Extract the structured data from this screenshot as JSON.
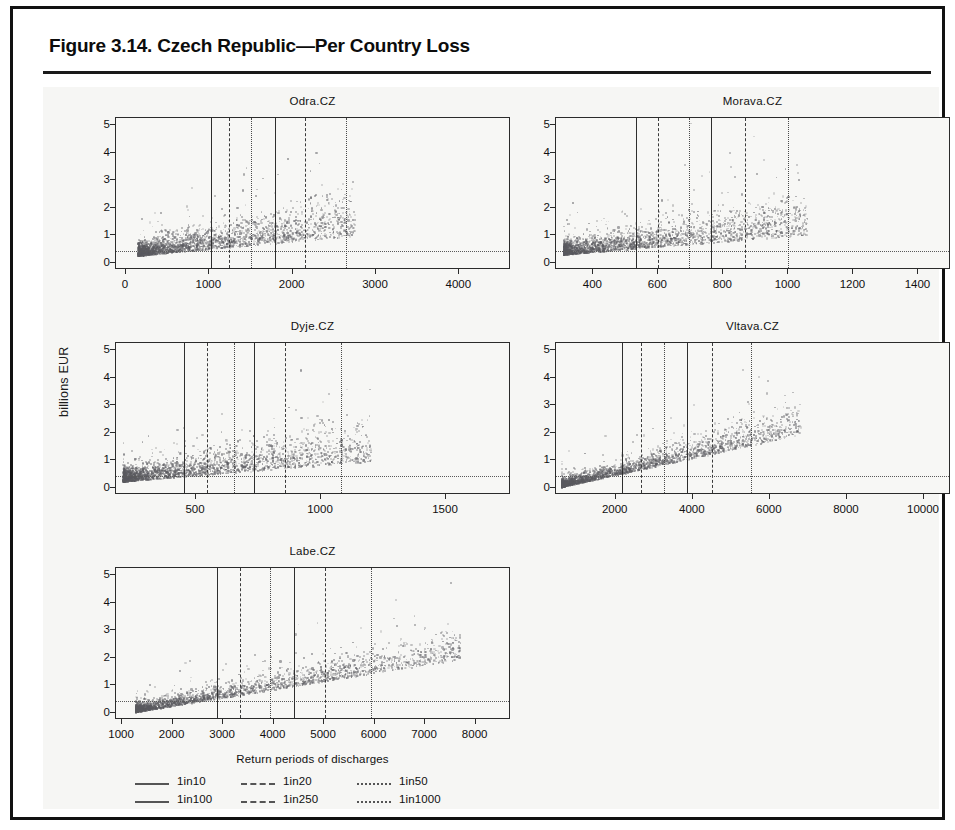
{
  "figure": {
    "title": "Figure 3.14. Czech Republic—Per Country Loss"
  },
  "axes": {
    "ylabel": "billions EUR",
    "xlabel": "Return periods of discharges"
  },
  "legend": {
    "items": [
      {
        "label": "1in10",
        "style": "solid"
      },
      {
        "label": "1in20",
        "style": "dashed"
      },
      {
        "label": "1in50",
        "style": "dotted"
      },
      {
        "label": "1in100",
        "style": "solid"
      },
      {
        "label": "1in250",
        "style": "dashed"
      },
      {
        "label": "1in1000",
        "style": "dotted"
      }
    ]
  },
  "chart_data": {
    "type": "scatter",
    "title": "Figure 3.14. Czech Republic—Per Country Loss",
    "xlabel": "Return periods of discharges",
    "ylabel": "billions EUR",
    "grid": false,
    "legend_position": "bottom-left",
    "ylim": [
      -0.25,
      5.25
    ],
    "yticks": [
      0,
      1,
      2,
      3,
      4,
      5
    ],
    "series_legend": [
      "1in10",
      "1in20",
      "1in50",
      "1in100",
      "1in250",
      "1in1000"
    ],
    "horizontal_reference_line": 0.42,
    "panels": [
      {
        "name": "Odra.CZ",
        "xlim": [
          -120,
          4620
        ],
        "xticks": [
          0,
          1000,
          2000,
          3000,
          4000
        ],
        "x_data_min": 150,
        "x_data_max": 2750,
        "cloud_y_typical": 0.55,
        "cloud_y_spread": 1.9,
        "vlines": [
          {
            "label": "1in10",
            "x": 1020,
            "style": "solid"
          },
          {
            "label": "1in20",
            "x": 1230,
            "style": "dashed"
          },
          {
            "label": "1in50",
            "x": 1500,
            "style": "dotted"
          },
          {
            "label": "1in100",
            "x": 1790,
            "style": "solid"
          },
          {
            "label": "1in250",
            "x": 2150,
            "style": "dashed"
          },
          {
            "label": "1in1000",
            "x": 2640,
            "style": "dotted"
          }
        ]
      },
      {
        "name": "Morava.CZ",
        "xlim": [
          285,
          1500
        ],
        "xticks": [
          400,
          600,
          800,
          1000,
          1200,
          1400
        ],
        "x_data_min": 310,
        "x_data_max": 1060,
        "cloud_y_typical": 0.62,
        "cloud_y_spread": 1.8,
        "vlines": [
          {
            "label": "1in10",
            "x": 530,
            "style": "solid"
          },
          {
            "label": "1in20",
            "x": 600,
            "style": "dashed"
          },
          {
            "label": "1in50",
            "x": 695,
            "style": "dotted"
          },
          {
            "label": "1in100",
            "x": 762,
            "style": "solid"
          },
          {
            "label": "1in250",
            "x": 865,
            "style": "dashed"
          },
          {
            "label": "1in1000",
            "x": 1000,
            "style": "dotted"
          }
        ]
      },
      {
        "name": "Dyje.CZ",
        "xlim": [
          180,
          1760
        ],
        "xticks": [
          500,
          1000,
          1500
        ],
        "x_data_min": 210,
        "x_data_max": 1200,
        "cloud_y_typical": 0.5,
        "cloud_y_spread": 1.7,
        "vlines": [
          {
            "label": "1in10",
            "x": 453,
            "style": "solid"
          },
          {
            "label": "1in20",
            "x": 543,
            "style": "dashed"
          },
          {
            "label": "1in50",
            "x": 650,
            "style": "dotted"
          },
          {
            "label": "1in100",
            "x": 730,
            "style": "solid"
          },
          {
            "label": "1in250",
            "x": 855,
            "style": "dashed"
          },
          {
            "label": "1in1000",
            "x": 1080,
            "style": "dotted"
          }
        ]
      },
      {
        "name": "Vltava.CZ",
        "xlim": [
          450,
          10700
        ],
        "xticks": [
          2000,
          4000,
          6000,
          8000,
          10000
        ],
        "x_data_min": 600,
        "x_data_max": 6800,
        "cloud_y_typical": 0.55,
        "cloud_y_spread": 1.2,
        "trend": true,
        "vlines": [
          {
            "label": "1in10",
            "x": 2150,
            "style": "solid"
          },
          {
            "label": "1in20",
            "x": 2650,
            "style": "dashed"
          },
          {
            "label": "1in50",
            "x": 3250,
            "style": "dotted"
          },
          {
            "label": "1in100",
            "x": 3850,
            "style": "solid"
          },
          {
            "label": "1in250",
            "x": 4500,
            "style": "dashed"
          },
          {
            "label": "1in1000",
            "x": 5500,
            "style": "dotted"
          }
        ]
      },
      {
        "name": "Labe.CZ",
        "xlim": [
          880,
          8700
        ],
        "xticks": [
          1000,
          2000,
          3000,
          4000,
          5000,
          6000,
          7000,
          8000
        ],
        "x_data_min": 1280,
        "x_data_max": 7700,
        "cloud_y_typical": 0.45,
        "cloud_y_spread": 1.3,
        "trend": true,
        "vlines": [
          {
            "label": "1in10",
            "x": 2870,
            "style": "solid"
          },
          {
            "label": "1in20",
            "x": 3330,
            "style": "dashed"
          },
          {
            "label": "1in50",
            "x": 3930,
            "style": "dotted"
          },
          {
            "label": "1in100",
            "x": 4400,
            "style": "solid"
          },
          {
            "label": "1in250",
            "x": 5020,
            "style": "dashed"
          },
          {
            "label": "1in1000",
            "x": 5930,
            "style": "dotted"
          }
        ]
      }
    ]
  },
  "layout": {
    "panel_boxes": [
      {
        "left": 72,
        "top": 30,
        "width": 395,
        "height": 152
      },
      {
        "left": 512,
        "top": 30,
        "width": 395,
        "height": 152
      },
      {
        "left": 72,
        "top": 255,
        "width": 395,
        "height": 152
      },
      {
        "left": 512,
        "top": 255,
        "width": 395,
        "height": 152
      },
      {
        "left": 72,
        "top": 480,
        "width": 395,
        "height": 152
      }
    ]
  }
}
